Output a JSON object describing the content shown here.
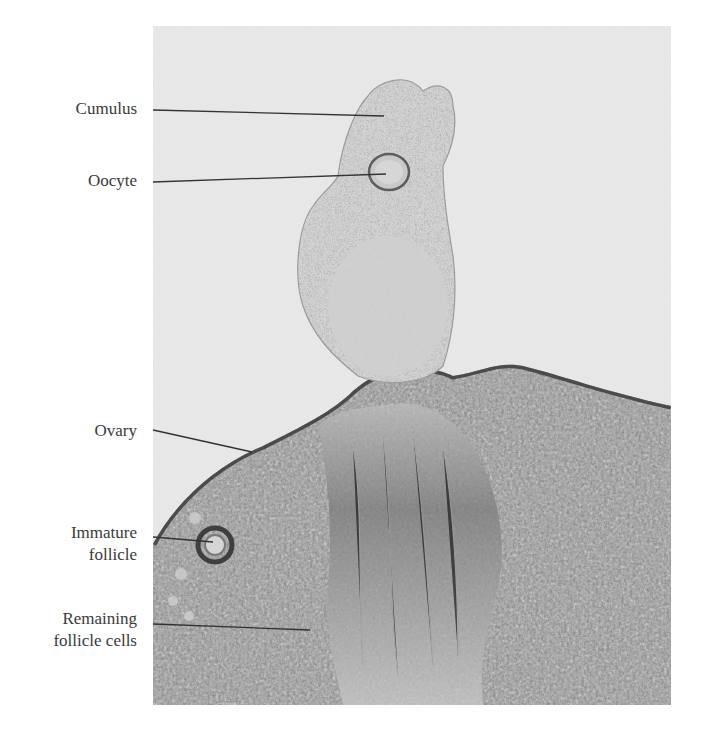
{
  "figure": {
    "type": "labeled micrograph",
    "labels": [
      {
        "id": "cumulus",
        "lines": [
          "Cumulus"
        ]
      },
      {
        "id": "oocyte",
        "lines": [
          "Oocyte"
        ]
      },
      {
        "id": "ovary",
        "lines": [
          "Ovary"
        ]
      },
      {
        "id": "immature-follicle",
        "lines": [
          "Immature",
          "follicle"
        ]
      },
      {
        "id": "remaining-follicle-cells",
        "lines": [
          "Remaining",
          "follicle cells"
        ]
      }
    ]
  },
  "colors": {
    "background": "#e9e9e9",
    "tissue_light": "#cfcfcf",
    "tissue_dark": "#4a4a4a",
    "nuclei": "#2e2e2e",
    "leader_line": "#333333",
    "label_text": "#3a3a3a"
  }
}
